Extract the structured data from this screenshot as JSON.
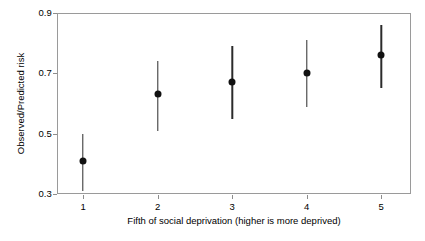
{
  "chart_data": {
    "type": "scatter",
    "title": "",
    "subtitle": "",
    "xlabel": "Fifth of social deprivation (higher is more deprived)",
    "ylabel": "Observed/Predicted risk",
    "categories": [
      "1",
      "2",
      "3",
      "4",
      "5"
    ],
    "x": [
      1,
      2,
      3,
      4,
      5
    ],
    "values": [
      0.41,
      0.63,
      0.67,
      0.7,
      0.76
    ],
    "error_low": [
      0.31,
      0.51,
      0.55,
      0.59,
      0.65
    ],
    "error_high": [
      0.5,
      0.74,
      0.79,
      0.81,
      0.86
    ],
    "series": [
      {
        "name": "Observed/Predicted risk",
        "values": [
          0.41,
          0.63,
          0.67,
          0.7,
          0.76
        ],
        "error_low": [
          0.31,
          0.51,
          0.55,
          0.59,
          0.65
        ],
        "error_high": [
          0.5,
          0.74,
          0.79,
          0.81,
          0.86
        ]
      }
    ],
    "points": [
      {
        "x": 1,
        "y": 0.41,
        "low": 0.31,
        "high": 0.5
      },
      {
        "x": 2,
        "y": 0.63,
        "low": 0.51,
        "high": 0.74
      },
      {
        "x": 3,
        "y": 0.67,
        "low": 0.55,
        "high": 0.79
      },
      {
        "x": 4,
        "y": 0.7,
        "low": 0.59,
        "high": 0.81
      },
      {
        "x": 5,
        "y": 0.76,
        "low": 0.65,
        "high": 0.86
      }
    ],
    "ylim": [
      0.3,
      0.9
    ],
    "xlim": [
      0.65,
      5.4
    ],
    "yticks": [
      0.3,
      0.5,
      0.7,
      0.9
    ],
    "ytick_labels": [
      "0.3",
      "0.5",
      "0.7",
      "0.9"
    ],
    "xticks": [
      1,
      2,
      3,
      4,
      5
    ],
    "xtick_labels": [
      "1",
      "2",
      "3",
      "4",
      "5"
    ],
    "grid": false,
    "legend": false,
    "legend_position": "none",
    "marker": "filled-circle",
    "marker_color": "#111111",
    "errorbar_color": "#2b2b2b",
    "frame_color": "#9a9a9a",
    "background": "#ffffff",
    "annotations": []
  },
  "axes": {
    "y": {
      "title": "Observed/Predicted risk",
      "ticks": [
        {
          "label": "0.9",
          "value": 0.9
        },
        {
          "label": "0.7",
          "value": 0.7
        },
        {
          "label": "0.5",
          "value": 0.5
        },
        {
          "label": "0.3",
          "value": 0.3
        }
      ]
    },
    "x": {
      "title": "Fifth of social deprivation (higher is more deprived)",
      "ticks": [
        {
          "label": "1",
          "value": 1
        },
        {
          "label": "2",
          "value": 2
        },
        {
          "label": "3",
          "value": 3
        },
        {
          "label": "4",
          "value": 4
        },
        {
          "label": "5",
          "value": 5
        }
      ]
    }
  }
}
